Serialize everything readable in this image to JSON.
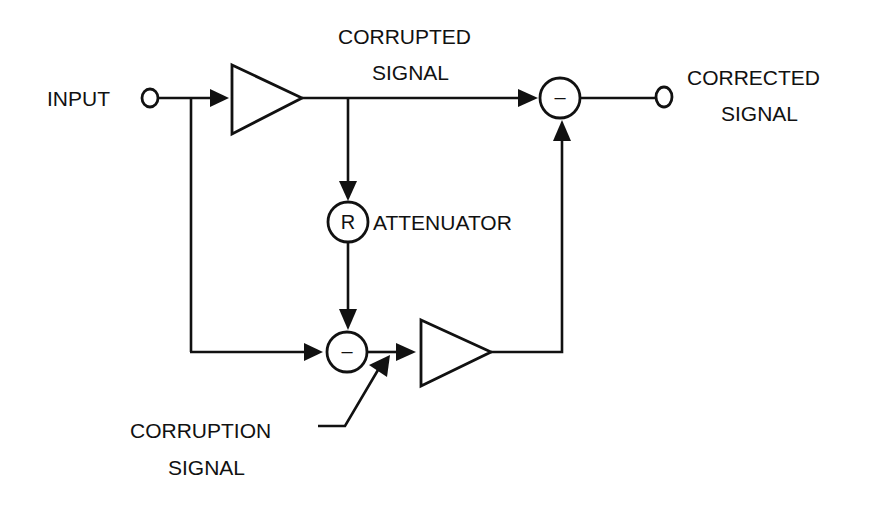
{
  "diagram": {
    "type": "block diagram",
    "labels": {
      "input": "INPUT",
      "corrupted_line1": "CORRUPTED",
      "corrupted_line2": "SIGNAL",
      "corrected_line1": "CORRECTED",
      "corrected_line2": "SIGNAL",
      "attenuator": "ATTENUATOR",
      "corruption_line1": "CORRUPTION",
      "corruption_line2": "SIGNAL"
    },
    "symbols": {
      "attenuator_symbol": "R",
      "subtractor_top_symbol": "–",
      "subtractor_bottom_symbol": "–"
    },
    "nodes": [
      {
        "id": "input-terminal",
        "kind": "terminal"
      },
      {
        "id": "amplifier-1",
        "kind": "amplifier"
      },
      {
        "id": "attenuator",
        "kind": "circle",
        "symbol": "R"
      },
      {
        "id": "subtractor-bottom",
        "kind": "summing-junction",
        "symbol": "–"
      },
      {
        "id": "amplifier-2",
        "kind": "amplifier"
      },
      {
        "id": "subtractor-top",
        "kind": "summing-junction",
        "symbol": "–"
      },
      {
        "id": "output-terminal",
        "kind": "terminal"
      }
    ],
    "edges": [
      {
        "from": "input-terminal",
        "to": "amplifier-1"
      },
      {
        "from": "input-terminal",
        "to": "subtractor-bottom"
      },
      {
        "from": "amplifier-1",
        "to": "subtractor-top",
        "label": "CORRUPTED SIGNAL"
      },
      {
        "from": "amplifier-1",
        "to": "attenuator"
      },
      {
        "from": "attenuator",
        "to": "subtractor-bottom"
      },
      {
        "from": "subtractor-bottom",
        "to": "amplifier-2"
      },
      {
        "from": "corruption-signal",
        "to": "amplifier-2-input"
      },
      {
        "from": "amplifier-2",
        "to": "subtractor-top"
      },
      {
        "from": "subtractor-top",
        "to": "output-terminal",
        "label": "CORRECTED SIGNAL"
      }
    ]
  }
}
